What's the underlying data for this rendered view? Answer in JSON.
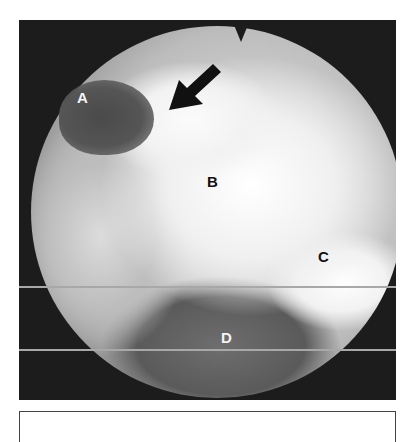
{
  "figure": {
    "type": "endoscopic-photograph",
    "labels": [
      {
        "id": "A",
        "text": "A",
        "tone": "light"
      },
      {
        "id": "B",
        "text": "B",
        "tone": "dark"
      },
      {
        "id": "C",
        "text": "C",
        "tone": "dark"
      },
      {
        "id": "D",
        "text": "D",
        "tone": "light"
      }
    ],
    "arrow": {
      "icon": "arrow-down-left-icon",
      "color": "#111111"
    },
    "colors": {
      "background": "#1c1c1c",
      "scanline": "#a8a8a8",
      "bright_tissue": "#f5f5f5",
      "dark_region": "#4a4a4a"
    }
  },
  "caption_box": {
    "text": ""
  }
}
